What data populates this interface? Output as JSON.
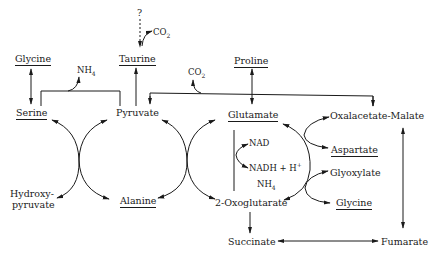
{
  "diagram": {
    "type": "metabolic-pathway",
    "nodes": {
      "question": "?",
      "co2_top": "CO",
      "co2_top_sub": "2",
      "taurine": "Taurine",
      "glycine_left": "Glycine",
      "nh4_top": "NH",
      "nh4_top_sub": "4",
      "co2_mid": "CO",
      "co2_mid_sub": "2",
      "proline": "Proline",
      "serine": "Serine",
      "pyruvate": "Pyruvate",
      "glutamate": "Glutamate",
      "oxalacetate_malate": "Oxalacetate-Malate",
      "nad": "NAD",
      "nadh": "NADH + H",
      "nadh_sup": "+",
      "nh4_mid": "NH",
      "nh4_mid_sub": "4",
      "aspartate": "Aspartate",
      "glyoxylate": "Glyoxylate",
      "hydroxypyruvate_1": "Hydroxy-",
      "hydroxypyruvate_2": "pyruvate",
      "alanine": "Alanine",
      "oxoglutarate": "2-Oxoglutarate",
      "glycine_right": "Glycine",
      "succinate": "Succinate",
      "fumarate": "Fumarate"
    },
    "underlined": [
      "Glycine",
      "Taurine",
      "Proline",
      "Serine",
      "Glutamate",
      "Aspartate",
      "Alanine",
      "Glycine"
    ],
    "colors": {
      "ink": "#1a1a1a",
      "background": "#ffffff"
    }
  }
}
